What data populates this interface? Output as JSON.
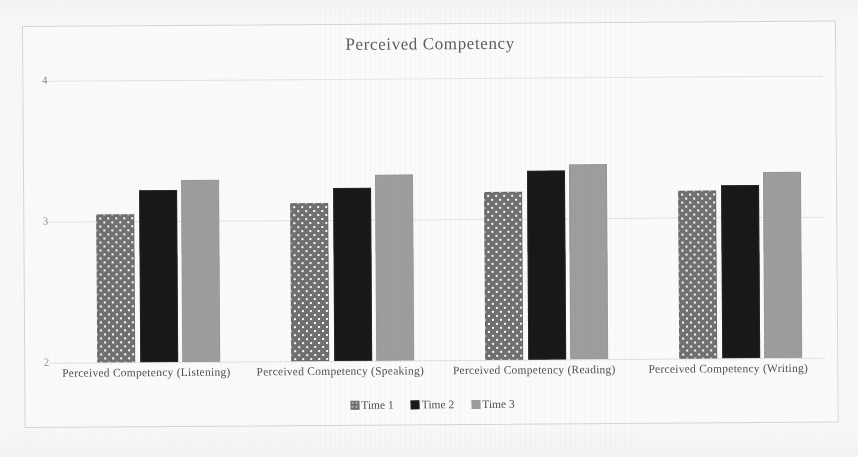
{
  "chart_data": {
    "type": "bar",
    "title": "Perceived Competency",
    "xlabel": "",
    "ylabel": "",
    "ylim": [
      2,
      4
    ],
    "yticks": [
      "2",
      "3",
      "4"
    ],
    "grid": true,
    "legend_position": "bottom",
    "categories": [
      "Perceived Competency (Listening)",
      "Perceived Competency (Speaking)",
      "Perceived Competency (Reading)",
      "Perceived Competency (Writing)"
    ],
    "series": [
      {
        "name": "Time 1",
        "color": "#6d6d6d",
        "pattern": "dotted",
        "values": [
          3.05,
          3.12,
          3.19,
          3.19
        ]
      },
      {
        "name": "Time 2",
        "color": "#111111",
        "pattern": "solid",
        "values": [
          3.22,
          3.23,
          3.34,
          3.23
        ]
      },
      {
        "name": "Time 3",
        "color": "#9d9d9d",
        "pattern": "solid",
        "values": [
          3.29,
          3.32,
          3.38,
          3.32
        ]
      }
    ]
  },
  "axis": {
    "tick_4": "4",
    "tick_3": "3",
    "tick_2": "2"
  },
  "legend": {
    "items": [
      {
        "label": "Time 1"
      },
      {
        "label": "Time 2"
      },
      {
        "label": "Time 3"
      }
    ]
  }
}
